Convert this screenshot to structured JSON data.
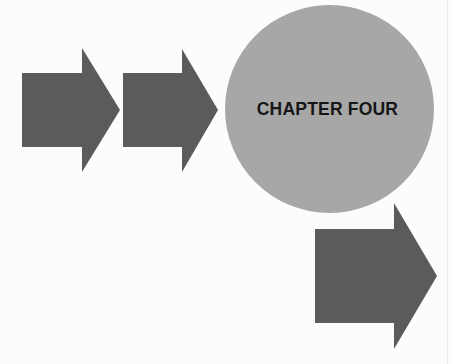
{
  "diagram": {
    "center_node": {
      "label": "CHAPTER FOUR",
      "shape": "circle",
      "fill": "#a7a7a7",
      "text_color": "#161616"
    },
    "arrows": [
      {
        "id": "arrow-1",
        "direction": "right",
        "fill": "#5b5b5b"
      },
      {
        "id": "arrow-2",
        "direction": "right",
        "fill": "#5b5b5b"
      },
      {
        "id": "arrow-3",
        "direction": "right",
        "fill": "#5b5b5b"
      }
    ],
    "background": "#fcfcfc"
  }
}
